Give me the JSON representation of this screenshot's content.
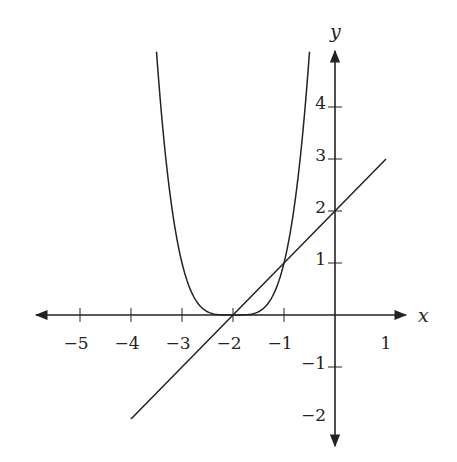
{
  "chart_data": {
    "type": "line",
    "title": "",
    "xlabel": "x",
    "ylabel": "y",
    "xlim": [
      -5.9,
      1.5
    ],
    "ylim": [
      -2.5,
      5.1
    ],
    "grid": false,
    "legend": null,
    "x_ticks": [
      -5,
      -4,
      -3,
      -2,
      -1,
      1
    ],
    "x_tick_labels": [
      "−5",
      "−4",
      "−3",
      "−2",
      "−1",
      "1"
    ],
    "y_ticks": [
      4,
      3,
      2,
      1,
      -1,
      -2
    ],
    "y_tick_labels": [
      "4",
      "3",
      "2",
      "1",
      "−1",
      "−2"
    ],
    "series": [
      {
        "name": "y = (x+2)^4",
        "kind": "curve",
        "x_range": [
          -3.5,
          -0.5
        ],
        "x": [
          -3.5,
          -3.25,
          -3.0,
          -2.75,
          -2.5,
          -2.25,
          -2.0,
          -1.75,
          -1.5,
          -1.25,
          -1.0,
          -0.75,
          -0.5
        ],
        "y": [
          5.06,
          2.44,
          1.0,
          0.32,
          0.06,
          0.004,
          0.0,
          0.004,
          0.06,
          0.32,
          1.0,
          2.44,
          5.06
        ]
      },
      {
        "name": "y = x + 2",
        "kind": "line",
        "x": [
          -4,
          1
        ],
        "y": [
          -2,
          3
        ]
      }
    ],
    "annotations": [
      {
        "type": "intersection",
        "x": -2,
        "y": 0
      },
      {
        "type": "intersection",
        "x": -1,
        "y": 1
      }
    ]
  },
  "style": {
    "stroke_color": "#222222",
    "background": "#ffffff"
  }
}
